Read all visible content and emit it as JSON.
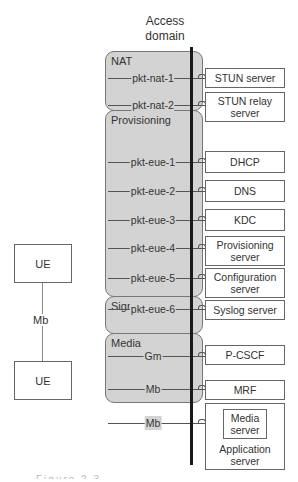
{
  "title": {
    "line1": "Access",
    "line2": "domain"
  },
  "groups": [
    {
      "label": "NAT"
    },
    {
      "label": "Provisioning"
    },
    {
      "label": "Signaling"
    },
    {
      "label": "Media"
    }
  ],
  "interfaces": [
    {
      "label": "pkt-nat-1"
    },
    {
      "label": "pkt-nat-2"
    },
    {
      "label": "pkt-eue-1"
    },
    {
      "label": "pkt-eue-2"
    },
    {
      "label": "pkt-eue-3"
    },
    {
      "label": "pkt-eue-4"
    },
    {
      "label": "pkt-eue-5"
    },
    {
      "label": "pkt-eue-6"
    },
    {
      "label": "Gm"
    },
    {
      "label": "Mb"
    },
    {
      "label": "Mb"
    }
  ],
  "servers": [
    {
      "line1": "STUN server"
    },
    {
      "line1": "STUN relay",
      "line2": "server"
    },
    {
      "line1": "DHCP"
    },
    {
      "line1": "DNS"
    },
    {
      "line1": "KDC"
    },
    {
      "line1": "Provisioning",
      "line2": "server"
    },
    {
      "line1": "Configuration",
      "line2": "server"
    },
    {
      "line1": "Syslog server"
    },
    {
      "line1": "P-CSCF"
    },
    {
      "line1": "MRF"
    },
    {
      "inner1": "Media",
      "inner2": "server",
      "line1": "Application",
      "line2": "server"
    }
  ],
  "ue": {
    "top": "UE",
    "bottom": "UE",
    "link": "Mb"
  },
  "caption": "Figure 2.3 ..."
}
